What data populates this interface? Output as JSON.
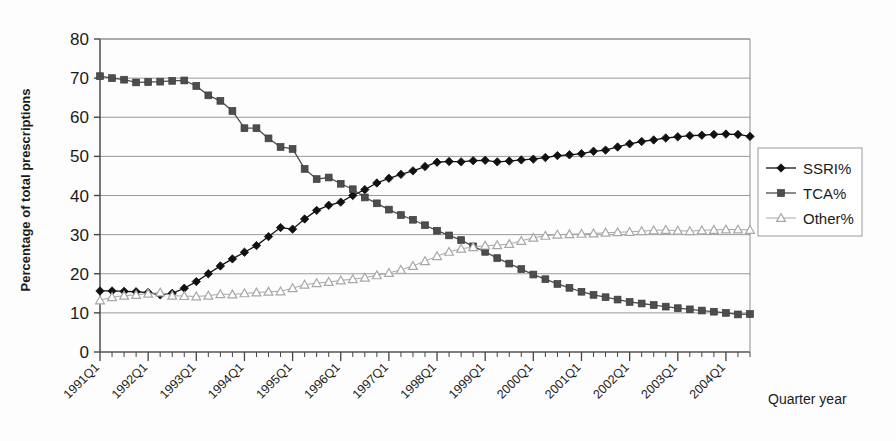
{
  "chart_data": {
    "type": "line",
    "title": "",
    "xlabel": "Quarter year",
    "ylabel": "Percentage of total prescriptions",
    "ylim": [
      0,
      80
    ],
    "ytick_step": 10,
    "yticks": [
      0,
      10,
      20,
      30,
      40,
      50,
      60,
      70,
      80
    ],
    "grid": true,
    "grid_axis": "y",
    "legend_position": "right-outside",
    "x_tick_labels": [
      "1991Q1",
      "1992Q1",
      "1993Q1",
      "1994Q1",
      "1995Q1",
      "1996Q1",
      "1997Q1",
      "1998Q1",
      "1999Q1",
      "2000Q1",
      "2001Q1",
      "2002Q1",
      "2003Q1",
      "2004Q1"
    ],
    "x_label_rotation_deg": -45,
    "x": [
      "1991Q1",
      "1991Q2",
      "1991Q3",
      "1991Q4",
      "1992Q1",
      "1992Q2",
      "1992Q3",
      "1992Q4",
      "1993Q1",
      "1993Q2",
      "1993Q3",
      "1993Q4",
      "1994Q1",
      "1994Q2",
      "1994Q3",
      "1994Q4",
      "1995Q1",
      "1995Q2",
      "1995Q3",
      "1995Q4",
      "1996Q1",
      "1996Q2",
      "1996Q3",
      "1996Q4",
      "1997Q1",
      "1997Q2",
      "1997Q3",
      "1997Q4",
      "1998Q1",
      "1998Q2",
      "1998Q3",
      "1998Q4",
      "1999Q1",
      "1999Q2",
      "1999Q3",
      "1999Q4",
      "2000Q1",
      "2000Q2",
      "2000Q3",
      "2000Q4",
      "2001Q1",
      "2001Q2",
      "2001Q3",
      "2001Q4",
      "2002Q1",
      "2002Q2",
      "2002Q3",
      "2002Q4",
      "2003Q1",
      "2003Q2",
      "2003Q3",
      "2003Q4",
      "2004Q1",
      "2004Q2",
      "2004Q3"
    ],
    "series": [
      {
        "name": "SSRI%",
        "marker": "filled-diamond",
        "color": "#111111",
        "values": [
          15.6,
          15.6,
          15.5,
          15.4,
          15.2,
          14.6,
          15.0,
          16.3,
          18.0,
          20.0,
          22.0,
          23.8,
          25.5,
          27.2,
          29.5,
          31.8,
          31.4,
          34.0,
          36.2,
          37.5,
          38.3,
          40.0,
          41.5,
          43.2,
          44.4,
          45.4,
          46.3,
          47.4,
          48.5,
          48.7,
          48.6,
          48.9,
          49.0,
          48.6,
          48.8,
          49.1,
          49.3,
          49.7,
          50.2,
          50.4,
          50.7,
          51.3,
          51.6,
          52.4,
          53.2,
          53.8,
          54.2,
          54.7,
          55.0,
          55.3,
          55.4,
          55.6,
          55.7,
          55.6,
          55.1
        ]
      },
      {
        "name": "TCA%",
        "marker": "filled-square",
        "color": "#4d4d4d",
        "values": [
          70.5,
          70.0,
          69.6,
          68.9,
          69.0,
          69.1,
          69.3,
          69.4,
          68.0,
          65.6,
          64.2,
          61.6,
          57.2,
          57.2,
          54.6,
          52.4,
          51.9,
          46.8,
          44.2,
          44.6,
          43.0,
          41.6,
          39.5,
          38.0,
          36.4,
          35.0,
          33.8,
          32.4,
          31.0,
          29.8,
          28.6,
          27.0,
          25.6,
          24.0,
          22.6,
          21.2,
          19.8,
          18.6,
          17.4,
          16.4,
          15.4,
          14.6,
          14.0,
          13.4,
          12.8,
          12.4,
          12.0,
          11.6,
          11.2,
          10.9,
          10.6,
          10.3,
          10.0,
          9.6,
          9.7
        ]
      },
      {
        "name": "Other%",
        "marker": "open-triangle",
        "color": "#a8a8a8",
        "values": [
          13.2,
          14.0,
          14.4,
          14.6,
          14.9,
          15.2,
          14.4,
          14.3,
          14.2,
          14.4,
          14.8,
          14.7,
          15.0,
          15.2,
          15.4,
          15.5,
          16.3,
          17.2,
          17.6,
          17.9,
          18.3,
          18.6,
          19.0,
          19.6,
          20.2,
          21.0,
          22.0,
          23.2,
          24.5,
          25.6,
          26.4,
          26.8,
          27.2,
          27.3,
          27.6,
          28.4,
          29.2,
          29.7,
          30.0,
          30.1,
          30.2,
          30.3,
          30.5,
          30.6,
          30.7,
          30.9,
          31.1,
          31.2,
          31.0,
          30.9,
          31.1,
          31.2,
          31.3,
          31.3,
          31.2
        ]
      }
    ]
  },
  "legend": {
    "entries": [
      {
        "label": "SSRI%",
        "marker": "filled-diamond",
        "color": "#111111"
      },
      {
        "label": "TCA%",
        "marker": "filled-square",
        "color": "#4d4d4d"
      },
      {
        "label": "Other%",
        "marker": "open-triangle",
        "color": "#a8a8a8"
      }
    ]
  }
}
